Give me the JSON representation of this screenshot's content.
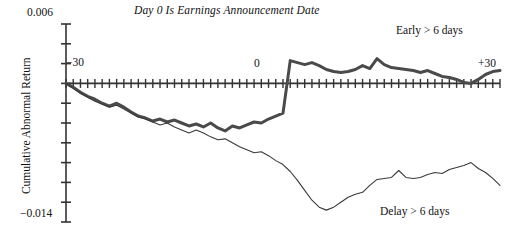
{
  "chart_data": {
    "type": "line",
    "title": "Day 0 Is Earnings Announcement Date",
    "xlabel": "",
    "ylabel": "Cumulative Abnormal Return",
    "ylim": [
      -0.014,
      0.006
    ],
    "xlim": [
      -30,
      30
    ],
    "grid": false,
    "legend_position": "inline-annotations",
    "y_tick_labels": [
      "0.006",
      "-0.014"
    ],
    "x_tick_labels": [
      "-30",
      "0",
      "+30"
    ],
    "y_tick_count": 10,
    "x_tick_count": 61,
    "axis_zero_level": 0.0,
    "series": [
      {
        "name": "Early > 6 days",
        "color": "#4a4a4a",
        "line_width": 3.0,
        "x": [
          -30,
          -29,
          -28,
          -27,
          -26,
          -25,
          -24,
          -23,
          -22,
          -21,
          -20,
          -19,
          -18,
          -17,
          -16,
          -15,
          -14,
          -13,
          -12,
          -11,
          -10,
          -9,
          -8,
          -7,
          -6,
          -5,
          -4,
          -3,
          -2,
          -1,
          0,
          1,
          2,
          3,
          4,
          5,
          6,
          7,
          8,
          9,
          10,
          11,
          12,
          13,
          14,
          15,
          16,
          17,
          18,
          19,
          20,
          21,
          22,
          23,
          24,
          25,
          26,
          27,
          28,
          29,
          30
        ],
        "values": [
          0.0,
          -0.0004,
          -0.0009,
          -0.0013,
          -0.0016,
          -0.002,
          -0.0023,
          -0.002,
          -0.0024,
          -0.0029,
          -0.0033,
          -0.0035,
          -0.0038,
          -0.0036,
          -0.0039,
          -0.0037,
          -0.004,
          -0.0043,
          -0.0041,
          -0.0044,
          -0.004,
          -0.0045,
          -0.0048,
          -0.0043,
          -0.0045,
          -0.0042,
          -0.0039,
          -0.004,
          -0.0036,
          -0.0033,
          -0.003,
          0.0023,
          0.0021,
          0.0019,
          0.0021,
          0.0018,
          0.0014,
          0.0012,
          0.0011,
          0.0012,
          0.0014,
          0.0018,
          0.0015,
          0.0025,
          0.0019,
          0.0016,
          0.0015,
          0.0014,
          0.0013,
          0.0011,
          0.0013,
          0.001,
          0.0007,
          0.0006,
          0.0004,
          0.0001,
          0.0,
          0.0004,
          0.0009,
          0.0012,
          0.0013
        ]
      },
      {
        "name": "Delay > 6 days",
        "color": "#3a3a3a",
        "line_width": 1.1,
        "x": [
          -30,
          -29,
          -28,
          -27,
          -26,
          -25,
          -24,
          -23,
          -22,
          -21,
          -20,
          -19,
          -18,
          -17,
          -16,
          -15,
          -14,
          -13,
          -12,
          -11,
          -10,
          -9,
          -8,
          -7,
          -6,
          -5,
          -4,
          -3,
          -2,
          -1,
          0,
          1,
          2,
          3,
          4,
          5,
          6,
          7,
          8,
          9,
          10,
          11,
          12,
          13,
          14,
          15,
          16,
          17,
          18,
          19,
          20,
          21,
          22,
          23,
          24,
          25,
          26,
          27,
          28,
          29,
          30
        ],
        "values": [
          0.0,
          -0.0005,
          -0.001,
          -0.0014,
          -0.0018,
          -0.0021,
          -0.0024,
          -0.0022,
          -0.0026,
          -0.003,
          -0.0034,
          -0.0036,
          -0.0039,
          -0.0042,
          -0.004,
          -0.0044,
          -0.0047,
          -0.005,
          -0.0047,
          -0.005,
          -0.0054,
          -0.0057,
          -0.0056,
          -0.006,
          -0.0064,
          -0.0067,
          -0.007,
          -0.0069,
          -0.0073,
          -0.0078,
          -0.0082,
          -0.0089,
          -0.0098,
          -0.0108,
          -0.0118,
          -0.0125,
          -0.0128,
          -0.0125,
          -0.012,
          -0.0115,
          -0.0112,
          -0.011,
          -0.0103,
          -0.0097,
          -0.0096,
          -0.0095,
          -0.0088,
          -0.0095,
          -0.0096,
          -0.0095,
          -0.0092,
          -0.009,
          -0.0091,
          -0.0087,
          -0.0085,
          -0.0083,
          -0.008,
          -0.0086,
          -0.009,
          -0.0096,
          -0.0103
        ]
      }
    ],
    "annotations": [
      {
        "name": "early-label",
        "text": "Early > 6 days"
      },
      {
        "name": "delay-label",
        "text": "Delay > 6 days"
      },
      {
        "name": "x-left-label",
        "text": "-30"
      },
      {
        "name": "x-zero-label",
        "text": "0"
      },
      {
        "name": "x-right-label",
        "text": "+30"
      }
    ]
  },
  "labels": {
    "title": "Day 0 Is Earnings Announcement Date",
    "y_axis_title": "Cumulative Abnormal Return",
    "y_max": "0.006",
    "y_min": "−0.014",
    "x_left": "−30",
    "x_zero": "0",
    "x_right": "+30",
    "legend_early": "Early > 6 days",
    "legend_delay": "Delay > 6 days"
  }
}
